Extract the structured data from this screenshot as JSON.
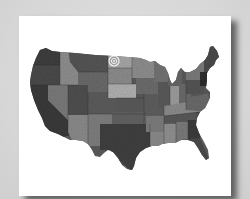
{
  "scene": {
    "background_color": "#d9d9d9",
    "card_color": "#ffffff",
    "shadow_color": "#555555"
  },
  "map": {
    "subject": "United States map (contiguous 48 states)",
    "style": "grayscale textured state map print",
    "colors": {
      "dark": "#3a3a3a",
      "mid": "#6b6b6b",
      "light": "#9a9a9a",
      "lighter": "#b5b5b5",
      "outline": "#2a2a2a"
    },
    "marker": {
      "type": "bullseye-target",
      "location": "North Dakota",
      "x": 114,
      "y": 61
    }
  }
}
